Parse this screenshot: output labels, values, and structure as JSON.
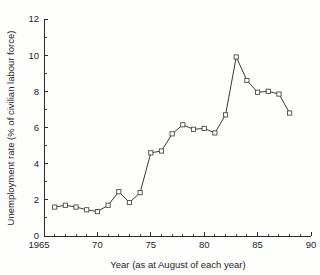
{
  "chart_data": {
    "type": "line",
    "title": "",
    "xlabel": "Year (as at August of each year)",
    "ylabel": "Unemployment rate (% of civilian labour force)",
    "xlim": [
      1965,
      1990
    ],
    "ylim": [
      0,
      12
    ],
    "grid": false,
    "legend": null,
    "x_tick_labels": [
      "1965",
      "70",
      "75",
      "80",
      "85",
      "90"
    ],
    "x_tick_values": [
      1965,
      1970,
      1975,
      1980,
      1985,
      1990
    ],
    "x_minor_step": 1,
    "y_tick_labels": [
      "0",
      "2",
      "4",
      "6",
      "8",
      "10",
      "12"
    ],
    "y_tick_values": [
      0,
      2,
      4,
      6,
      8,
      10,
      12
    ],
    "y_minor_step": 1,
    "marker": "open-square",
    "x": [
      1966,
      1967,
      1968,
      1969,
      1970,
      1971,
      1972,
      1973,
      1974,
      1975,
      1976,
      1977,
      1978,
      1979,
      1980,
      1981,
      1982,
      1983,
      1984,
      1985,
      1986,
      1987,
      1988
    ],
    "values": [
      1.6,
      1.7,
      1.6,
      1.45,
      1.35,
      1.7,
      2.45,
      1.85,
      2.4,
      4.6,
      4.7,
      5.65,
      6.15,
      5.9,
      5.95,
      5.7,
      6.7,
      9.9,
      8.6,
      7.95,
      8.0,
      7.85,
      6.8
    ],
    "series": [
      {
        "name": "Unemployment rate",
        "values": [
          1.6,
          1.7,
          1.6,
          1.45,
          1.35,
          1.7,
          2.45,
          1.85,
          2.4,
          4.6,
          4.7,
          5.65,
          6.15,
          5.9,
          5.95,
          5.7,
          6.7,
          9.9,
          8.6,
          7.95,
          8.0,
          7.85,
          6.8
        ]
      }
    ],
    "colors": {
      "line": "#3a3a3a",
      "marker_fill": "#ffffff",
      "marker_stroke": "#4a4a4a",
      "axis": "#2b2b2b",
      "background": "#fdfdfc"
    }
  }
}
